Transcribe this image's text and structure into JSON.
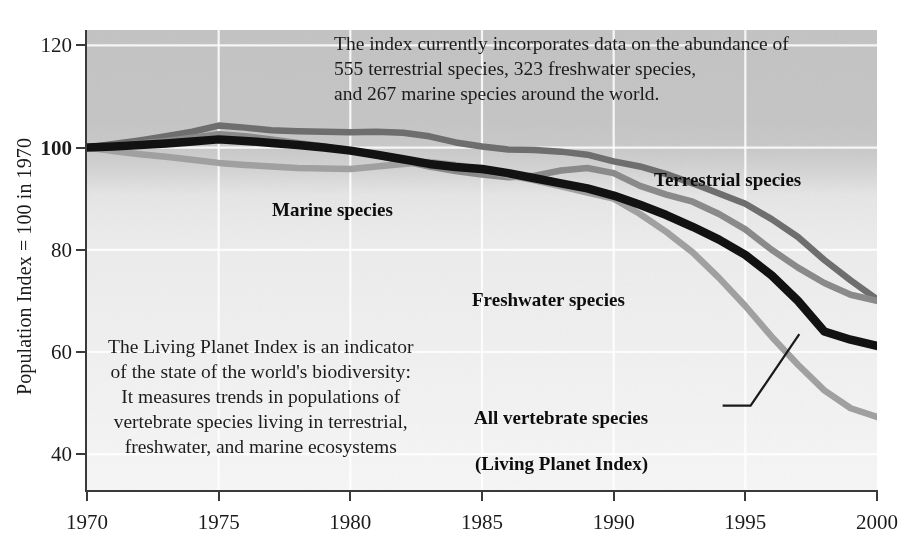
{
  "chart_data": {
    "type": "line",
    "title": "",
    "xlabel": "",
    "ylabel": "Population Index = 100 in 1970",
    "xlim": [
      1970,
      2000
    ],
    "ylim": [
      33,
      123
    ],
    "grid": true,
    "legend_position": "inline-labels",
    "xticks": [
      "1970",
      "1975",
      "1980",
      "1985",
      "1990",
      "1995",
      "2000"
    ],
    "yticks": [
      "120",
      "100",
      "80",
      "60",
      "40"
    ],
    "x": [
      1970,
      1971,
      1972,
      1973,
      1974,
      1975,
      1976,
      1977,
      1978,
      1979,
      1980,
      1981,
      1982,
      1983,
      1984,
      1985,
      1986,
      1987,
      1988,
      1989,
      1990,
      1991,
      1992,
      1993,
      1994,
      1995,
      1996,
      1997,
      1998,
      1999,
      2000
    ],
    "series": [
      {
        "name": "Terrestrial species",
        "color": "#6e6e6e",
        "values": [
          100,
          100.7,
          101.4,
          102.2,
          103.1,
          104.3,
          103.9,
          103.4,
          103.2,
          103.1,
          103.0,
          103.1,
          102.9,
          102.2,
          101.0,
          100.2,
          99.6,
          99.5,
          99.2,
          98.6,
          97.3,
          96.3,
          94.8,
          93.0,
          91.0,
          89.0,
          86.0,
          82.5,
          78.0,
          74.0,
          70.3
        ]
      },
      {
        "name": "Freshwater species",
        "color": "#8a8a8a",
        "values": [
          100,
          100.4,
          100.8,
          101.3,
          101.9,
          102.6,
          102.2,
          101.6,
          100.9,
          100.2,
          99.4,
          98.5,
          97.4,
          96.3,
          95.4,
          94.7,
          94.2,
          94.5,
          95.5,
          96.0,
          95.0,
          92.5,
          90.8,
          89.4,
          87.0,
          84.0,
          80.0,
          76.5,
          73.5,
          71.2,
          70.0
        ]
      },
      {
        "name": "Marine species",
        "color": "#a0a0a0",
        "values": [
          100,
          99.3,
          98.7,
          98.2,
          97.6,
          97.0,
          96.6,
          96.3,
          96.0,
          95.9,
          95.8,
          96.3,
          96.8,
          97.2,
          96.6,
          95.6,
          94.6,
          93.6,
          92.4,
          91.2,
          90.0,
          87.0,
          83.5,
          79.5,
          74.5,
          69.0,
          63.0,
          57.5,
          52.5,
          49.0,
          47.3
        ]
      },
      {
        "name": "All vertebrate species (Living Planet Index)",
        "color": "#121212",
        "values": [
          100,
          100.2,
          100.5,
          100.8,
          101.2,
          101.6,
          101.3,
          100.9,
          100.5,
          100.0,
          99.4,
          98.6,
          97.7,
          96.8,
          96.2,
          95.8,
          95.0,
          94.0,
          93.0,
          92.0,
          90.6,
          88.8,
          86.8,
          84.5,
          82.0,
          79.0,
          75.0,
          70.0,
          64.0,
          62.4,
          61.2
        ]
      }
    ],
    "annotations": [
      {
        "id": "top-note",
        "lines": [
          "The index currently incorporates data on the abundance of",
          "555 terrestrial species, 323 freshwater species,",
          "and 267 marine species around the world."
        ]
      },
      {
        "id": "left-note",
        "lines": [
          "The Living Planet Index is an indicator",
          "of the state of the world's biodiversity:",
          "It measures trends in populations of",
          "vertebrate species living in terrestrial,",
          "freshwater, and marine ecosystems"
        ]
      }
    ],
    "series_labels": {
      "marine": "Marine species",
      "terrestrial": "Terrestrial species",
      "freshwater": "Freshwater species",
      "vertebrate_line1": "All vertebrate species",
      "vertebrate_line2": "(Living Planet Index)"
    }
  }
}
